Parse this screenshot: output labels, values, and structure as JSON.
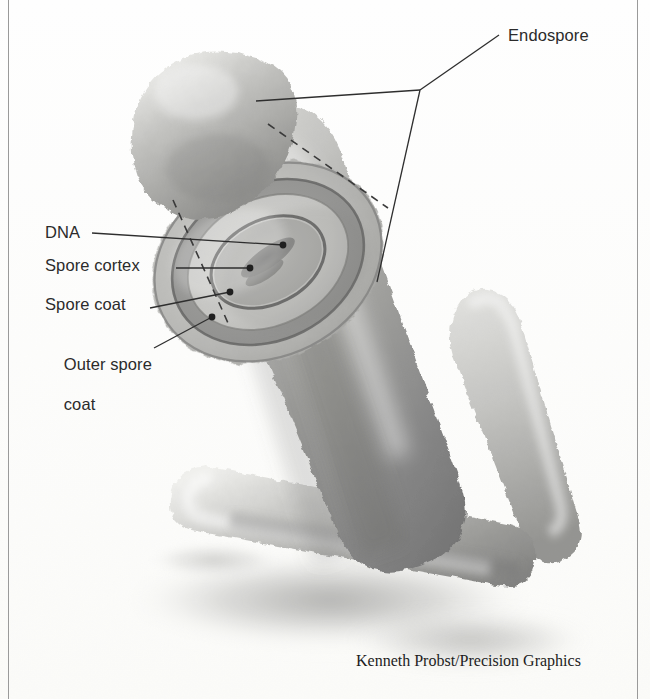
{
  "figure": {
    "background_color": "#fdfdfb",
    "ink_color": "#2b2b2b",
    "credit": "Kenneth Probst/Precision Graphics"
  },
  "labels": {
    "endospore": "Endospore",
    "dna": "DNA",
    "spore_cortex": "Spore cortex",
    "spore_coat": "Spore coat",
    "outer_spore_coat_line1": "Outer spore",
    "outer_spore_coat_line2": "coat"
  },
  "diagram": {
    "style": "grayscale airbrush scientific illustration",
    "structures": [
      {
        "name": "free-endospore",
        "description": "detached released endospore, upper left, rough bumpy outline"
      },
      {
        "name": "endospore-cross-section",
        "description": "concentric elliptical layers cut away inside the cell"
      },
      {
        "name": "dna-core",
        "description": "dark elongated nucleoid mass at the centre of the spore"
      },
      {
        "name": "mother-cell-rod",
        "description": "large rod-shaped bacterium running diagonally"
      },
      {
        "name": "secondary-rod-right",
        "description": "second rod behind, to the right"
      },
      {
        "name": "secondary-rod-bottom",
        "description": "third horizontal rod across the lower area"
      }
    ],
    "layer_tones": {
      "outer_spore_coat": "#b4b4b2",
      "spore_coat": "#8e8e8c",
      "spore_cortex": "#c6c6c3",
      "core": "#aeaeab",
      "dna": "#6f6f6e"
    }
  }
}
